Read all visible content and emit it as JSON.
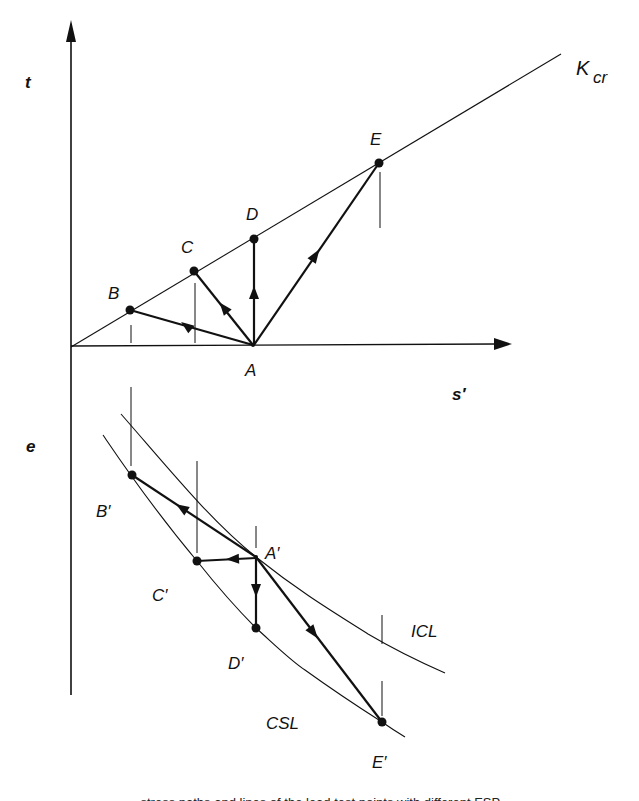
{
  "figure": {
    "top_panel": {
      "y_axis_label": "t",
      "x_axis_label": "s′",
      "line_label_main": "K",
      "line_label_sub": "cr",
      "points": {
        "A": "A",
        "B": "B",
        "C": "C",
        "D": "D",
        "E": "E"
      }
    },
    "bottom_panel": {
      "y_axis_label": "e",
      "curve_upper_label": "ICL",
      "curve_lower_label": "CSL",
      "points": {
        "A": "A′",
        "B": "B′",
        "C": "C′",
        "D": "D′",
        "E": "E′"
      }
    },
    "caption_partial": "...stress paths and lines of the lead test points with different ESP..."
  },
  "colors": {
    "ink": "#111111",
    "background": "#ffffff"
  }
}
